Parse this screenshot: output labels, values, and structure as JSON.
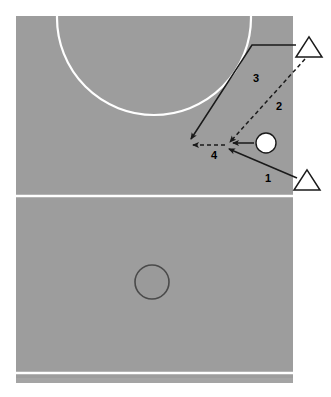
{
  "diagram": {
    "type": "sports-tactic-board",
    "sport": "handball",
    "colors": {
      "court_fill": "#9d9d9d",
      "court_line": "#ffffff",
      "background": "#ffffff",
      "arrow": "#1a1a1a",
      "player_marker": "#1a1a1a",
      "ball_fill": "#ffffff",
      "ball_stroke": "#1a1a1a",
      "spot_fill": "#9a9a9a",
      "spot_stroke": "#4a4a4a"
    },
    "court": {
      "x": 16,
      "y": 16,
      "width": 277,
      "height": 362,
      "halfway_line_y": 196,
      "baseline_y": 373,
      "outer_strip_y": 378,
      "outer_strip_height": 5
    },
    "goal_arc": {
      "label": "goal-area-arc",
      "center_x": 154,
      "center_y": 18,
      "radius": 97
    },
    "center_spot": {
      "label": "center-spot",
      "cx": 152,
      "cy": 282,
      "r": 17
    },
    "ball": {
      "label": "ball",
      "cx": 266,
      "cy": 143,
      "r": 10
    },
    "players": [
      {
        "id": "player-top",
        "shape": "triangle",
        "cx": 309,
        "cy": 47,
        "size": 13
      },
      {
        "id": "player-bottom",
        "shape": "triangle",
        "cx": 307,
        "cy": 180,
        "size": 13
      }
    ],
    "convergence_point": {
      "x": 228,
      "y": 148
    },
    "movements": [
      {
        "number": "1",
        "style": "solid",
        "kind": "player-run",
        "label_x": 268,
        "label_y": 182,
        "from_x": 297,
        "from_y": 178,
        "to_x": 229,
        "to_y": 148,
        "description": "Player runs from bottom right toward the ball"
      },
      {
        "number": "2",
        "style": "dashed",
        "kind": "pass",
        "label_x": 279,
        "label_y": 110,
        "from_x": 305,
        "from_y": 59,
        "to_x": 230,
        "to_y": 142,
        "description": "Pass from the top right player down to the receiving point"
      },
      {
        "number": "3",
        "style": "solid",
        "kind": "player-run",
        "label_x": 256,
        "label_y": 82,
        "from_x": 296,
        "from_y": 45,
        "to_x": 191,
        "to_y": 139,
        "description": "Top right player cuts toward the goal area"
      },
      {
        "number": "4",
        "style": "dashed",
        "kind": "pass",
        "label_x": 214,
        "label_y": 159,
        "from_x": 225,
        "from_y": 145,
        "to_x": 192,
        "to_y": 145,
        "description": "Short pass to the cutting player"
      },
      {
        "number": "",
        "style": "solid",
        "kind": "ball-transfer",
        "label_x": 0,
        "label_y": 0,
        "from_x": 254,
        "from_y": 143,
        "to_x": 232,
        "to_y": 143,
        "description": "Ball moves to the receiving point"
      }
    ]
  }
}
